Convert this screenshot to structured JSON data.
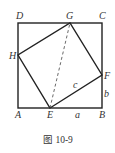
{
  "figure": {
    "caption": "图 10-9",
    "points": {
      "A": {
        "label": "A",
        "x": 18,
        "y": 108
      },
      "B": {
        "label": "B",
        "x": 102,
        "y": 108
      },
      "C": {
        "label": "C",
        "x": 102,
        "y": 23
      },
      "D": {
        "label": "D",
        "x": 18,
        "y": 23
      },
      "E": {
        "label": "E",
        "x": 50,
        "y": 108
      },
      "F": {
        "label": "F",
        "x": 102,
        "y": 75
      },
      "G": {
        "label": "G",
        "x": 70,
        "y": 23
      },
      "H": {
        "label": "H",
        "x": 18,
        "y": 55
      }
    },
    "segment_labels": {
      "a": "a",
      "b": "b",
      "c": "c"
    },
    "colors": {
      "stroke": "#222222",
      "text": "#333333"
    }
  }
}
